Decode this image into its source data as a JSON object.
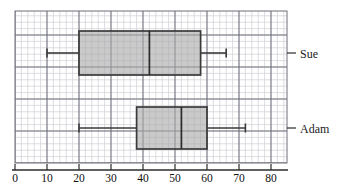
{
  "chart_data": {
    "type": "box",
    "title": "",
    "xlabel": "",
    "ylabel": "",
    "xlim": [
      0,
      85
    ],
    "grid": true,
    "grid_minor_step": 2,
    "grid_major_step": 10,
    "orientation": "horizontal",
    "axis": {
      "ticks": [
        0,
        10,
        20,
        30,
        40,
        50,
        60,
        70,
        80
      ],
      "tick_labels": [
        "0",
        "10",
        "20",
        "30",
        "40",
        "50",
        "60",
        "70",
        "80"
      ]
    },
    "categories": [
      "Sue",
      "Adam"
    ],
    "series": [
      {
        "name": "Sue",
        "min": 10,
        "q1": 20,
        "median": 42,
        "q3": 58,
        "max": 66
      },
      {
        "name": "Adam",
        "min": 20,
        "q1": 38,
        "median": 52,
        "q3": 60,
        "max": 72
      }
    ],
    "colors": {
      "box_fill": "#a9a9a9",
      "box_stroke": "#3a3a3a",
      "whisker": "#3a3a3a",
      "median": "#2b2b2b",
      "grid_minor": "#cfcfd6",
      "grid_major": "#6f6f7a",
      "axis": "#2b2b2b",
      "text": "#1a1a1a"
    }
  },
  "labels": {
    "sue": "Sue",
    "adam": "Adam"
  },
  "ticks": {
    "t0": "0",
    "t10": "10",
    "t20": "20",
    "t30": "30",
    "t40": "40",
    "t50": "50",
    "t60": "60",
    "t70": "70",
    "t80": "80"
  }
}
